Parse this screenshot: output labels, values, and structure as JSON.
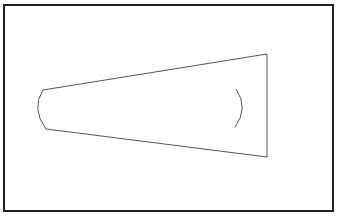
{
  "diagram": {
    "type": "geometric-shape",
    "colors": {
      "background": "#ffffff",
      "frame_stroke": "#222222",
      "shape_stroke": "#555555"
    },
    "frame": {
      "x": 4,
      "y": 5,
      "width": 329,
      "height": 206,
      "stroke_width": 2
    },
    "shape": {
      "top_edge": {
        "x1": 43,
        "y1": 90,
        "x2": 267,
        "y2": 54
      },
      "bottom_edge": {
        "x1": 46,
        "y1": 129,
        "x2": 267,
        "y2": 157
      },
      "right_edge": {
        "x1": 267,
        "y1": 54,
        "x2": 267,
        "y2": 157
      },
      "left_arc": {
        "start": [
          43,
          90
        ],
        "control": [
          31,
          109
        ],
        "end": [
          46,
          129
        ]
      },
      "inner_arc": {
        "start": [
          236,
          89
        ],
        "control": [
          249,
          108
        ],
        "end": [
          235,
          127
        ]
      }
    }
  }
}
